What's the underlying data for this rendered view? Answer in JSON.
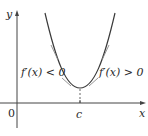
{
  "figure": {
    "axes": {
      "x_label": "x",
      "y_label": "y",
      "origin_label": "0",
      "critical_point_label": "c"
    },
    "annotations": {
      "left": "f′(x) < 0",
      "right": "f′(x) > 0"
    },
    "colors": {
      "curve": "#3a3a3a",
      "axes": "#444444",
      "tangents": "#8a8a8a",
      "text": "#2a2a2a"
    }
  }
}
